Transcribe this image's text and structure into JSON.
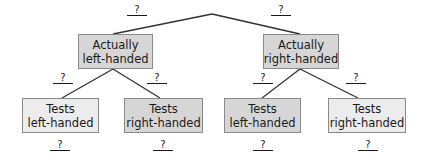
{
  "diagram": {
    "type": "tree-diagram",
    "colors": {
      "line": "#333333",
      "box_border": "#8a8a8a",
      "box_dark": "#d6d6d6",
      "box_light": "#ececec",
      "text": "#1a1a1a"
    },
    "root": {
      "branches": [
        {
          "edge_label": "?",
          "node": {
            "line1": "Actually",
            "line2": "left-handed"
          },
          "branches": [
            {
              "edge_label": "?",
              "node": {
                "line1": "Tests",
                "line2": "left-handed"
              },
              "result_label": "?"
            },
            {
              "edge_label": "?",
              "node": {
                "line1": "Tests",
                "line2": "right-handed"
              },
              "result_label": "?"
            }
          ]
        },
        {
          "edge_label": "?",
          "node": {
            "line1": "Actually",
            "line2": "right-handed"
          },
          "branches": [
            {
              "edge_label": "?",
              "node": {
                "line1": "Tests",
                "line2": "left-handed"
              },
              "result_label": "?"
            },
            {
              "edge_label": "?",
              "node": {
                "line1": "Tests",
                "line2": "right-handed"
              },
              "result_label": "?"
            }
          ]
        }
      ]
    }
  }
}
